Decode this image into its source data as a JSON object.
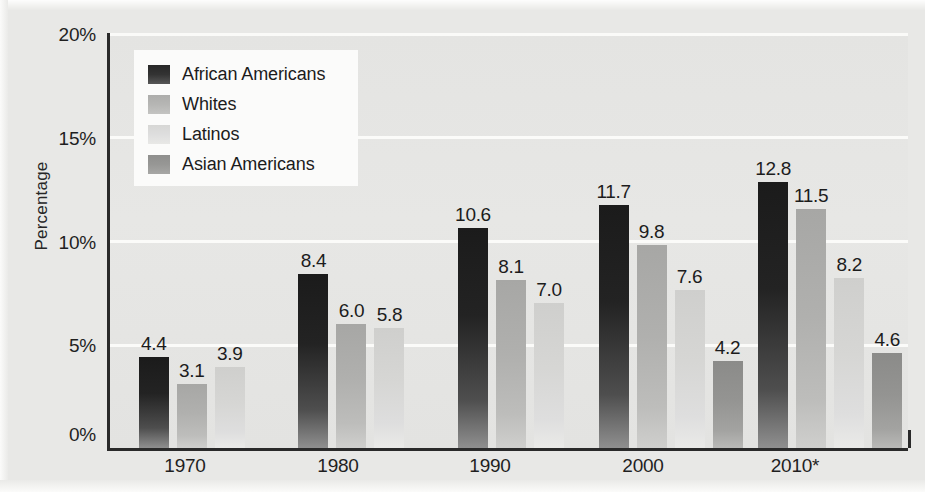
{
  "chart_data": {
    "type": "bar",
    "title": "",
    "subtitle": "",
    "xlabel": "",
    "ylabel": "Percentage",
    "categories": [
      "1970",
      "1980",
      "1990",
      "2000",
      "2010*"
    ],
    "ylim": [
      0,
      20
    ],
    "ytick_labels": [
      "0%",
      "5%",
      "10%",
      "15%",
      "20%"
    ],
    "ytick_values": [
      0,
      5,
      10,
      15,
      20
    ],
    "grid": true,
    "legend_position": "upper-left-inside",
    "value_label_format": "one-decimal",
    "series": [
      {
        "name": "African Americans",
        "color": "#232323",
        "values": [
          4.4,
          8.4,
          10.6,
          11.7,
          12.8
        ],
        "labels": [
          "4.4",
          "8.4",
          "10.6",
          "11.7",
          "12.8"
        ]
      },
      {
        "name": "Whites",
        "color": "#b0b0ae",
        "values": [
          3.1,
          6.0,
          8.1,
          9.8,
          11.5
        ],
        "labels": [
          "3.1",
          "6.0",
          "8.1",
          "9.8",
          "11.5"
        ]
      },
      {
        "name": "Latinos",
        "color": "#d8d8d6",
        "values": [
          3.9,
          5.8,
          7.0,
          7.6,
          8.2
        ],
        "labels": [
          "3.9",
          "5.8",
          "7.0",
          "7.6",
          "8.2"
        ]
      },
      {
        "name": "Asian Americans",
        "color": "#949492",
        "values": [
          null,
          null,
          null,
          4.2,
          4.6
        ],
        "labels": [
          "",
          "",
          "",
          "4.2",
          "4.6"
        ]
      }
    ]
  },
  "axis": {
    "y_title": "Percentage",
    "y_ticks": [
      {
        "label": "20%",
        "value": 20
      },
      {
        "label": "15%",
        "value": 15
      },
      {
        "label": "10%",
        "value": 10
      },
      {
        "label": "5%",
        "value": 5
      },
      {
        "label": "0%",
        "value": 0
      }
    ],
    "x_ticks": [
      {
        "label": "1970"
      },
      {
        "label": "1980"
      },
      {
        "label": "1990"
      },
      {
        "label": "2000"
      },
      {
        "label": "2010*"
      }
    ]
  },
  "legend": {
    "items": [
      {
        "label": "African Americans",
        "swatch": "series-0-swatch"
      },
      {
        "label": "Whites",
        "swatch": "series-1-swatch"
      },
      {
        "label": "Latinos",
        "swatch": "series-2-swatch"
      },
      {
        "label": "Asian Americans",
        "swatch": "series-3-swatch"
      }
    ]
  }
}
